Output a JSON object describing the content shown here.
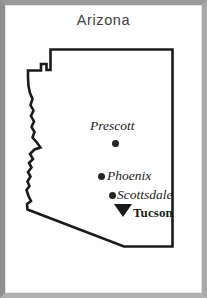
{
  "map": {
    "title": "Arizona",
    "state_name": "Arizona",
    "colors": {
      "frame": "#9a9a9a",
      "background": "#fefefe",
      "outline": "#1b1b1b",
      "marker": "#252525",
      "title_text": "#404040",
      "label_text": "#1b1b1b"
    },
    "cities": [
      {
        "id": "prescott",
        "name": "Prescott",
        "marker": "circle-dot-marker",
        "label_style": "italic-serif"
      },
      {
        "id": "phoenix",
        "name": "Phoenix",
        "marker": "circle-dot-marker",
        "label_style": "italic-serif"
      },
      {
        "id": "scottsdale",
        "name": "Scottsdale",
        "marker": "circle-dot-marker",
        "label_style": "italic-serif"
      },
      {
        "id": "tucson",
        "name": "Tucson",
        "marker": "down-triangle-marker",
        "label_style": "bold-serif"
      }
    ]
  }
}
